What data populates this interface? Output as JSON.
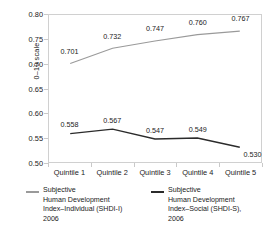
{
  "chart_data": {
    "type": "line",
    "title": "",
    "xlabel": "",
    "ylabel": "0–10 scale",
    "categories": [
      "Quintile 1",
      "Quintile 2",
      "Quintile 3",
      "Quintile 4",
      "Quintile 5"
    ],
    "ylim": [
      0.5,
      0.8
    ],
    "ytick_labels": [
      "0.80",
      "0.75",
      "0.70",
      "0.65",
      "0.60",
      "0.55",
      "0.50"
    ],
    "ytick_values": [
      0.8,
      0.75,
      0.7,
      0.65,
      0.6,
      0.55,
      0.5
    ],
    "grid": false,
    "legend_position": "bottom",
    "series": [
      {
        "name": "Subjective Human Development Index–Individual (SHDI-I) 2006",
        "color": "#9a9a9a",
        "values": [
          0.701,
          0.732,
          0.747,
          0.76,
          0.767
        ],
        "labels": [
          "0.701",
          "0.732",
          "0.747",
          "0.760",
          "0.767"
        ]
      },
      {
        "name": "Subjective Human Development Index–Social (SHDI-S), 2006",
        "color": "#2b2b2b",
        "values": [
          0.558,
          0.567,
          0.547,
          0.549,
          0.53
        ],
        "labels": [
          "0.558",
          "0.567",
          "0.547",
          "0.549",
          "0.530"
        ]
      }
    ]
  },
  "legend": {
    "entries": [
      {
        "swatch_color": "#9a9a9a",
        "line1": "Subjective",
        "line2": "Human Development",
        "line3": "Index–Individual (SHDI-I)",
        "line4": "2006"
      },
      {
        "swatch_color": "#2b2b2b",
        "line1": "Subjective",
        "line2": "Human Development",
        "line3": "Index–Social (SHDI-S),",
        "line4": "2006"
      }
    ]
  }
}
